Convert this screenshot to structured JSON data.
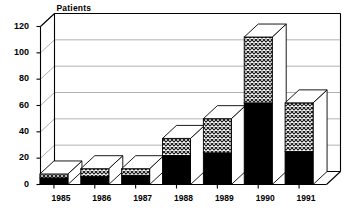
{
  "chart_data": {
    "type": "bar",
    "subtype": "stacked-3d-column",
    "title": "",
    "ylabel": "Patients",
    "xlabel": "",
    "categories": [
      "1985",
      "1986",
      "1987",
      "1988",
      "1989",
      "1990",
      "1991"
    ],
    "series": [
      {
        "name": "lower-solid-black",
        "fill": "solid-black",
        "values": [
          5,
          6,
          7,
          22,
          24,
          62,
          25
        ]
      },
      {
        "name": "upper-crosshatch",
        "fill": "crosshatch-gray",
        "values": [
          3,
          6,
          5,
          13,
          26,
          50,
          37
        ]
      }
    ],
    "totals": [
      8,
      12,
      12,
      35,
      50,
      112,
      62
    ],
    "ylim": [
      0,
      120
    ],
    "yticks": [
      "0",
      "20",
      "40",
      "60",
      "80",
      "100",
      "120"
    ],
    "ytick_values": [
      0,
      20,
      40,
      60,
      80,
      100,
      120
    ],
    "grid": true,
    "grid_axis": "y",
    "legend": "none",
    "colors": {
      "axis": "#000000",
      "grid": "#8f8f8f",
      "series_lower": "#000000",
      "series_upper": "#b4b4b4",
      "bar_outline": "#000000",
      "bar_top_face": "#ffffff",
      "background": "#ffffff"
    }
  },
  "axis": {
    "y_title": "Patients"
  }
}
